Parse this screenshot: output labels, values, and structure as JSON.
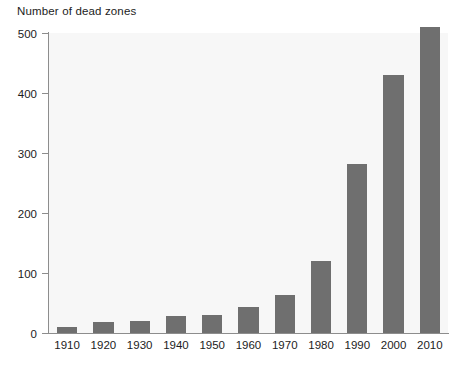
{
  "chart_data": {
    "type": "bar",
    "title": "Number of dead zones",
    "xlabel": "",
    "ylabel": "Number of dead zones",
    "categories": [
      "1910",
      "1920",
      "1930",
      "1940",
      "1950",
      "1960",
      "1970",
      "1980",
      "1990",
      "2000",
      "2010"
    ],
    "values": [
      10,
      18,
      20,
      29,
      30,
      43,
      64,
      120,
      281,
      430,
      510
    ],
    "ylim": [
      0,
      500
    ],
    "yticks": [
      0,
      100,
      200,
      300,
      400,
      500
    ],
    "ytick_labels": [
      "0",
      "100",
      "200",
      "300",
      "400",
      "500"
    ],
    "grid": false,
    "legend": null,
    "bar_color": "#6f6f6f",
    "plot_background": "#f7f7f7",
    "axis_color": "#8d8d8d"
  }
}
